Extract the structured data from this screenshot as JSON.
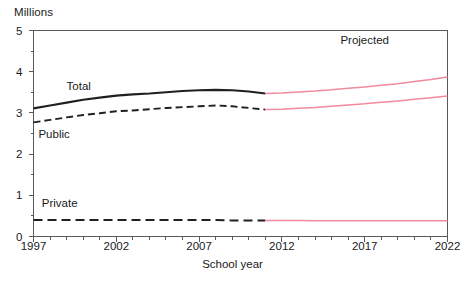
{
  "chart_data": {
    "type": "line",
    "title": "",
    "ylabel": "Millions",
    "xlabel": "School year",
    "ylim": [
      0,
      5
    ],
    "xlim": [
      1997,
      2022
    ],
    "grid": false,
    "legend_position": "inline-labels",
    "y_ticks": [
      "0",
      "1",
      "2",
      "3",
      "4",
      "5"
    ],
    "y_minor_ticks": [
      0.5,
      1.5,
      2.5,
      3.5,
      4.5
    ],
    "x_ticks": [
      "1997",
      "2002",
      "2007",
      "2012",
      "2017",
      "2022"
    ],
    "x_minor_tick_interval": 1,
    "annotations": [
      {
        "text": "Projected",
        "x": 2017.0,
        "y": 4.75
      }
    ],
    "projection_start_year": 2011,
    "colors": {
      "actual": "#231f20",
      "projected": "#f2899c",
      "frame": "#58595b",
      "text": "#1a1a1a"
    },
    "x": [
      1997,
      1998,
      1999,
      2000,
      2001,
      2002,
      2003,
      2004,
      2005,
      2006,
      2007,
      2008,
      2009,
      2010,
      2011,
      2012,
      2013,
      2014,
      2015,
      2016,
      2017,
      2018,
      2019,
      2020,
      2021,
      2022
    ],
    "series": [
      {
        "name": "Total",
        "style": "solid",
        "label_x": 1999.0,
        "label_y": 3.62,
        "values": [
          3.11,
          3.18,
          3.25,
          3.32,
          3.37,
          3.42,
          3.45,
          3.47,
          3.5,
          3.53,
          3.55,
          3.56,
          3.55,
          3.52,
          3.47,
          3.48,
          3.51,
          3.53,
          3.56,
          3.6,
          3.63,
          3.67,
          3.71,
          3.76,
          3.81,
          3.87
        ]
      },
      {
        "name": "Public",
        "style": "dashed",
        "label_x": 1997.3,
        "label_y": 2.47,
        "values": [
          2.77,
          2.83,
          2.89,
          2.95,
          2.99,
          3.04,
          3.06,
          3.09,
          3.12,
          3.14,
          3.16,
          3.18,
          3.16,
          3.12,
          3.08,
          3.09,
          3.11,
          3.13,
          3.16,
          3.19,
          3.22,
          3.26,
          3.29,
          3.33,
          3.37,
          3.41
        ]
      },
      {
        "name": "Private",
        "style": "dashed",
        "label_x": 1997.5,
        "label_y": 0.78,
        "values": [
          0.4,
          0.4,
          0.4,
          0.4,
          0.4,
          0.4,
          0.4,
          0.4,
          0.4,
          0.4,
          0.4,
          0.4,
          0.39,
          0.39,
          0.39,
          0.39,
          0.39,
          0.38,
          0.38,
          0.38,
          0.38,
          0.38,
          0.38,
          0.38,
          0.38,
          0.38
        ]
      }
    ]
  }
}
